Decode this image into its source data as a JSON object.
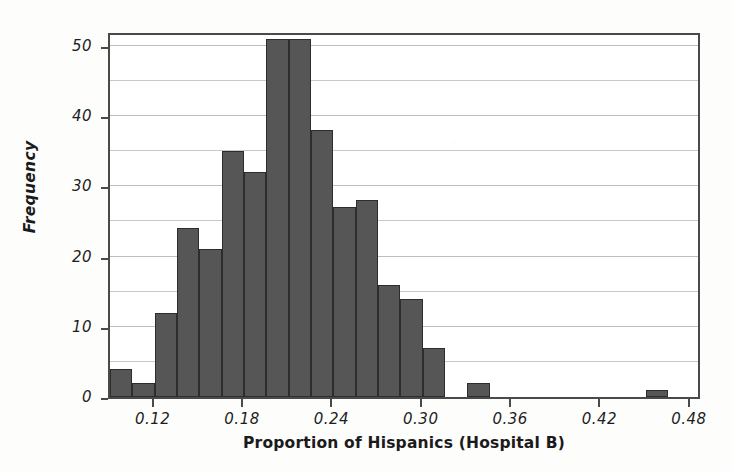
{
  "chart_data": {
    "type": "bar",
    "title": "",
    "subtitle": "",
    "xlabel": "Proportion of Hispanics (Hospital B)",
    "ylabel": "Frequency",
    "grid": true,
    "legend": "none",
    "bin_width": 0.015,
    "bin_start": 0.09,
    "xlim": [
      0.09,
      0.4875
    ],
    "ylim": [
      0,
      52.1
    ],
    "xticks": [
      "0.12",
      "0.18",
      "0.24",
      "0.30",
      "0.36",
      "0.42",
      "0.48"
    ],
    "xtick_values": [
      0.12,
      0.18,
      0.24,
      0.3,
      0.36,
      0.42,
      0.48
    ],
    "yticks": [
      "0",
      "10",
      "20",
      "30",
      "40",
      "50"
    ],
    "ytick_values": [
      0,
      10,
      20,
      30,
      40,
      50
    ],
    "minor_gridline_values": [
      5,
      10,
      15,
      20,
      25,
      30,
      35,
      40,
      45,
      50
    ],
    "categories": [
      "0.090-0.105",
      "0.105-0.120",
      "0.120-0.135",
      "0.135-0.150",
      "0.150-0.165",
      "0.165-0.180",
      "0.180-0.195",
      "0.195-0.210",
      "0.210-0.225",
      "0.225-0.240",
      "0.240-0.255",
      "0.255-0.270",
      "0.270-0.285",
      "0.285-0.300",
      "0.300-0.315",
      "0.315-0.330",
      "0.330-0.345",
      "0.345-0.360",
      "0.360-0.375",
      "0.375-0.390",
      "0.390-0.405",
      "0.405-0.420",
      "0.420-0.435",
      "0.435-0.450",
      "0.450-0.465",
      "0.465-0.480"
    ],
    "bin_left_edges": [
      0.09,
      0.105,
      0.12,
      0.135,
      0.15,
      0.165,
      0.18,
      0.195,
      0.21,
      0.225,
      0.24,
      0.255,
      0.27,
      0.285,
      0.3,
      0.315,
      0.33,
      0.345,
      0.36,
      0.375,
      0.39,
      0.405,
      0.42,
      0.435,
      0.45,
      0.465
    ],
    "values": [
      4,
      2,
      12,
      24,
      21,
      35,
      32,
      51,
      51,
      38,
      27,
      28,
      16,
      14,
      7,
      0,
      2,
      0,
      0,
      0,
      0,
      0,
      0,
      0,
      1,
      0
    ],
    "series": [
      {
        "name": "Frequency",
        "values": [
          4,
          2,
          12,
          24,
          21,
          35,
          32,
          51,
          51,
          38,
          27,
          28,
          16,
          14,
          7,
          0,
          2,
          0,
          0,
          0,
          0,
          0,
          0,
          0,
          1,
          0
        ]
      }
    ],
    "colors": {
      "bar_fill": "#565656",
      "bar_edge": "#2d2d2d",
      "gridline": "#c9c9c9",
      "axis": "#4a4a4a",
      "text": "#1b1b1b",
      "background": "#ffffff"
    }
  }
}
